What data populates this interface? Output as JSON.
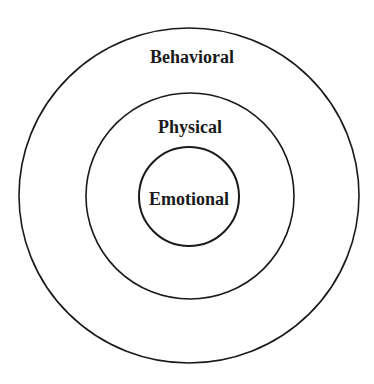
{
  "diagram": {
    "type": "concentric-circles",
    "rings": [
      {
        "label": "Behavioral",
        "level": "outer"
      },
      {
        "label": "Physical",
        "level": "middle"
      },
      {
        "label": "Emotional",
        "level": "inner"
      }
    ],
    "colors": {
      "stroke": "#1a1a1a",
      "text": "#1a1a1a",
      "background": "#ffffff"
    }
  }
}
